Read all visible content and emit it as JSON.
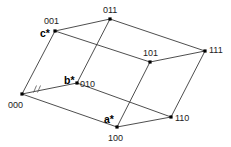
{
  "diagram": {
    "type": "parallelepiped-lattice",
    "vertices": [
      {
        "id": "000",
        "label": "000",
        "x": 22,
        "y": 94,
        "lx": 8,
        "ly": 108
      },
      {
        "id": "001",
        "label": "001",
        "x": 55,
        "y": 31,
        "lx": 44,
        "ly": 24
      },
      {
        "id": "010",
        "label": "010",
        "x": 77,
        "y": 83,
        "lx": 80,
        "ly": 87
      },
      {
        "id": "011",
        "label": "011",
        "x": 110,
        "y": 19,
        "lx": 103,
        "ly": 13
      },
      {
        "id": "100",
        "label": "100",
        "x": 117,
        "y": 127,
        "lx": 108,
        "ly": 141
      },
      {
        "id": "101",
        "label": "101",
        "x": 150,
        "y": 62,
        "lx": 143,
        "ly": 56
      },
      {
        "id": "110",
        "label": "110",
        "x": 171,
        "y": 117,
        "lx": 175,
        "ly": 121
      },
      {
        "id": "111",
        "label": "111",
        "x": 205,
        "y": 51,
        "lx": 209,
        "ly": 53
      }
    ],
    "edges": [
      [
        "000",
        "001"
      ],
      [
        "000",
        "010"
      ],
      [
        "000",
        "100"
      ],
      [
        "001",
        "011"
      ],
      [
        "001",
        "101"
      ],
      [
        "010",
        "011"
      ],
      [
        "010",
        "110"
      ],
      [
        "100",
        "101"
      ],
      [
        "100",
        "110"
      ],
      [
        "011",
        "111"
      ],
      [
        "101",
        "111"
      ],
      [
        "110",
        "111"
      ]
    ],
    "axis_labels": [
      {
        "id": "a-star",
        "text": "a*",
        "x": 104,
        "y": 123,
        "at": "100"
      },
      {
        "id": "b-star",
        "text": "b*",
        "x": 64,
        "y": 84,
        "at": "010"
      },
      {
        "id": "c-star",
        "text": "c*",
        "x": 40,
        "y": 37,
        "at": "001"
      }
    ],
    "break_mark": {
      "on_edge": [
        "000",
        "010"
      ],
      "text": "//",
      "x": 37,
      "y": 89
    }
  }
}
